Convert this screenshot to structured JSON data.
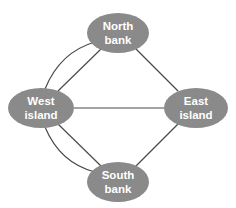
{
  "diagram": {
    "type": "graph",
    "title": "",
    "colors": {
      "node_fill": "#8a8a8a",
      "node_text": "#ffffff",
      "edge": "#4a4a4a",
      "background": "#ffffff"
    },
    "nodes": [
      {
        "id": "north",
        "line1": "North",
        "line2": "bank"
      },
      {
        "id": "west",
        "line1": "West",
        "line2": "island"
      },
      {
        "id": "east",
        "line1": "East",
        "line2": "island"
      },
      {
        "id": "south",
        "line1": "South",
        "line2": "bank"
      }
    ],
    "edges": [
      {
        "from": "west",
        "to": "north",
        "shape": "curved"
      },
      {
        "from": "west",
        "to": "north",
        "shape": "straight"
      },
      {
        "from": "west",
        "to": "south",
        "shape": "curved"
      },
      {
        "from": "west",
        "to": "south",
        "shape": "straight"
      },
      {
        "from": "west",
        "to": "east",
        "shape": "straight"
      },
      {
        "from": "north",
        "to": "east",
        "shape": "straight"
      },
      {
        "from": "south",
        "to": "east",
        "shape": "straight"
      }
    ]
  }
}
